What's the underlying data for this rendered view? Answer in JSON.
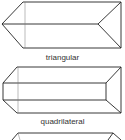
{
  "figures": [
    {
      "name": "triangular-prism",
      "label": "triangular"
    },
    {
      "name": "quadrilateral-prism",
      "label": "quadrilateral"
    },
    {
      "name": "partial-prism",
      "label": ""
    }
  ],
  "colors": {
    "stroke": "#222222",
    "background": "#ffffff"
  }
}
